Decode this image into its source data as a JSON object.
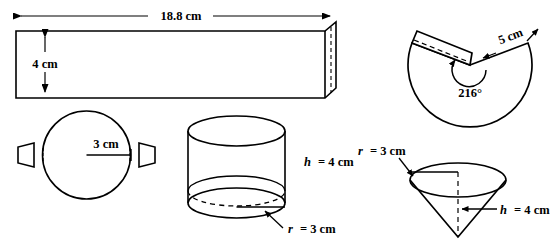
{
  "figure": {
    "stroke_color": "#000000",
    "fill_color": "#ffffff",
    "background": "#ffffff"
  },
  "cylinder_net": {
    "rectangle": {
      "length_label": "18.8 cm",
      "height_label": "4 cm"
    },
    "circle": {
      "radius_label": "3 cm"
    }
  },
  "cylinder_solid": {
    "height_label": "h = 4 cm",
    "height_var": "h",
    "height_value": "= 4 cm",
    "radius_label": "r = 3 cm",
    "radius_var": "r",
    "radius_value": "= 3 cm"
  },
  "cone_net": {
    "sector": {
      "angle_label": "216°",
      "radius_label": "5 cm"
    }
  },
  "cone_solid": {
    "radius_label": "r = 3 cm",
    "radius_var": "r",
    "radius_value": "= 3 cm",
    "height_label": "h = 4 cm",
    "height_var": "h",
    "height_value": "= 4 cm"
  }
}
